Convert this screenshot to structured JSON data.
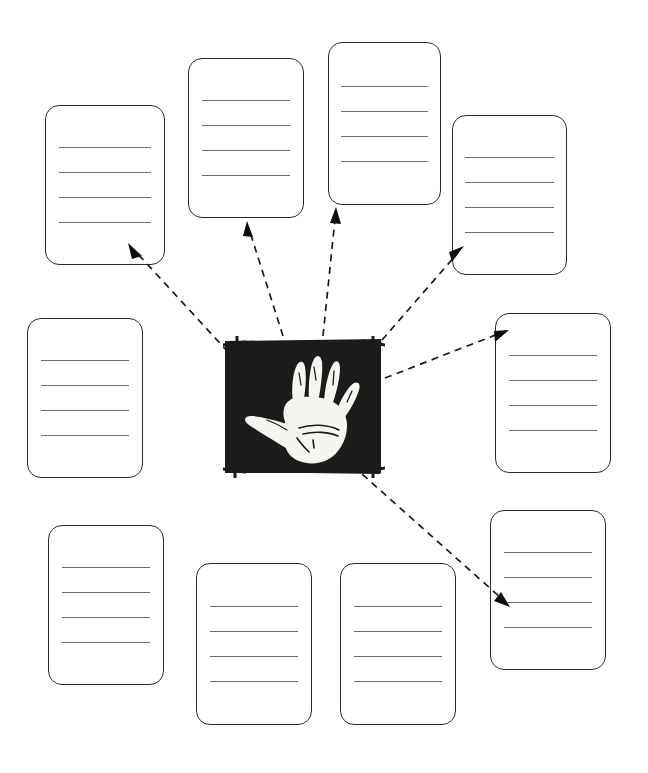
{
  "page": {
    "background_color": "#ffffff",
    "width": 648,
    "height": 773,
    "line_color": "#6d6d6d",
    "box_border_color": "#2b2b2b",
    "arrow_color": "#1a1a1a"
  },
  "center_image": {
    "name": "hand-stencil-photo",
    "description": "Black rectangular photograph of a white hand stencil (negative hand print) on a dark cave wall, with small light tick marks at the four corners",
    "alt_text": "prehistoric hand stencil",
    "background_color": "#1b1b1b",
    "hand_color": "#f7f5ef",
    "x": 223,
    "y": 336,
    "width": 162,
    "height": 142
  },
  "notes": [
    {
      "id": "note-1",
      "label": "",
      "position": "top-left",
      "lines": [
        "",
        "",
        "",
        ""
      ],
      "x": 45,
      "y": 105,
      "width": 120,
      "height": 160
    },
    {
      "id": "note-2",
      "label": "",
      "position": "top-center-left",
      "lines": [
        "",
        "",
        "",
        ""
      ],
      "x": 188,
      "y": 58,
      "width": 116,
      "height": 160
    },
    {
      "id": "note-3",
      "label": "",
      "position": "top-center-right",
      "lines": [
        "",
        "",
        "",
        ""
      ],
      "x": 328,
      "y": 42,
      "width": 113,
      "height": 163
    },
    {
      "id": "note-4",
      "label": "",
      "position": "top-right",
      "lines": [
        "",
        "",
        "",
        ""
      ],
      "x": 452,
      "y": 115,
      "width": 115,
      "height": 160
    },
    {
      "id": "note-5",
      "label": "",
      "position": "middle-left",
      "lines": [
        "",
        "",
        "",
        ""
      ],
      "x": 27,
      "y": 318,
      "width": 116,
      "height": 160
    },
    {
      "id": "note-6",
      "label": "",
      "position": "middle-right",
      "lines": [
        "",
        "",
        "",
        ""
      ],
      "x": 495,
      "y": 313,
      "width": 116,
      "height": 160
    },
    {
      "id": "note-7",
      "label": "",
      "position": "bottom-left",
      "lines": [
        "",
        "",
        "",
        ""
      ],
      "x": 48,
      "y": 525,
      "width": 116,
      "height": 160
    },
    {
      "id": "note-8",
      "label": "",
      "position": "bottom-center-left",
      "lines": [
        "",
        "",
        "",
        ""
      ],
      "x": 196,
      "y": 563,
      "width": 116,
      "height": 162
    },
    {
      "id": "note-9",
      "label": "",
      "position": "bottom-center-right",
      "lines": [
        "",
        "",
        "",
        ""
      ],
      "x": 340,
      "y": 563,
      "width": 116,
      "height": 162
    },
    {
      "id": "note-10",
      "label": "",
      "position": "bottom-right",
      "lines": [
        "",
        "",
        "",
        ""
      ],
      "x": 490,
      "y": 510,
      "width": 116,
      "height": 160
    }
  ],
  "connectors": [
    {
      "id": "connector-1",
      "style": "dashed-arrow",
      "from": "center_image",
      "to": "note-1",
      "from_point": [
        228,
        352
      ],
      "to_point": [
        130,
        246
      ]
    },
    {
      "id": "connector-2",
      "style": "dashed-arrow",
      "from": "center_image",
      "to": "note-2",
      "from_point": [
        283,
        336
      ],
      "to_point": [
        248,
        224
      ]
    },
    {
      "id": "connector-3",
      "style": "dashed-arrow",
      "from": "center_image",
      "to": "note-3",
      "from_point": [
        323,
        336
      ],
      "to_point": [
        336,
        210
      ]
    },
    {
      "id": "connector-4",
      "style": "dashed-arrow",
      "from": "center_image",
      "to": "note-4",
      "from_point": [
        382,
        340
      ],
      "to_point": [
        462,
        248
      ]
    },
    {
      "id": "connector-5",
      "style": "dashed-arrow",
      "from": "center_image",
      "to": "note-6",
      "from_point": [
        385,
        378
      ],
      "to_point": [
        504,
        332
      ]
    },
    {
      "id": "connector-6",
      "style": "dashed-arrow",
      "from": "center_image",
      "to": "note-10",
      "from_point": [
        353,
        466
      ],
      "to_point": [
        508,
        605
      ]
    }
  ],
  "icons": {
    "arrow_head": "solid-triangle",
    "corner_ticks": "photo-corner-tick"
  }
}
